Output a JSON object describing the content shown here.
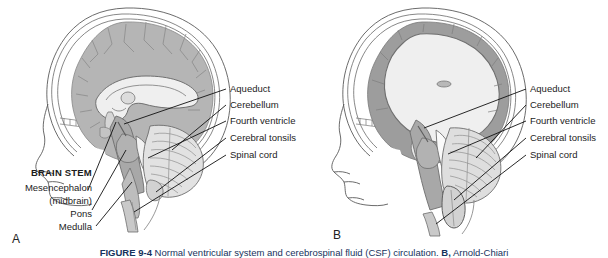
{
  "figure": {
    "caption_prefix": "FIGURE 9-4",
    "caption_text": "Normal ventricular system and cerebrospinal fluid (CSF) circulation.",
    "caption_bold_b": "B,",
    "caption_text_b": "Arnold-Chiari"
  },
  "panel_a": {
    "letter": "A",
    "right_labels": [
      "Aqueduct",
      "Cerebellum",
      "Fourth ventricle",
      "Cerebral tonsils",
      "Spinal cord"
    ],
    "left_labels": [
      "BRAIN STEM",
      "Mesencephalon",
      "(midbrain)",
      "Pons",
      "Medulla"
    ]
  },
  "panel_b": {
    "letter": "B",
    "right_labels": [
      "Aqueduct",
      "Cerebellum",
      "Fourth ventricle",
      "Cerebral tonsils",
      "Spinal cord"
    ]
  },
  "colors": {
    "cortex_gray": "#b5b5b5",
    "cortex_dark": "#9a9a9a",
    "ventricle_light": "#efefef",
    "brainstem_gray": "#a8a8a8",
    "cerebellum": "#e2e2e2",
    "outline": "#4a4a4a",
    "leader": "#111111",
    "text": "#1c1c1c"
  }
}
